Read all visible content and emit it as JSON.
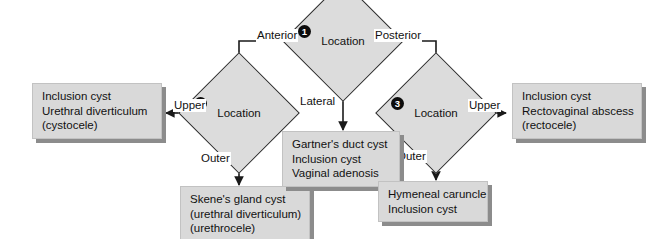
{
  "diagram": {
    "colors": {
      "node_fill": "#dcdcdc",
      "node_stroke": "#2b2b2b",
      "box_fill": "#d9d9d9",
      "box_shadow": "#8c8c8c",
      "badge_fill": "#0c0c0c",
      "badge_text": "#ffffff",
      "background": "#ffffff",
      "edge_stroke": "#1a1a1a"
    },
    "decisions": [
      {
        "id": "d1",
        "badge": "1",
        "label": "Location"
      },
      {
        "id": "d2",
        "badge": "2",
        "label": "Location"
      },
      {
        "id": "d3",
        "badge": "3",
        "label": "Location"
      }
    ],
    "edge_labels": {
      "anterior": "Anterior",
      "posterior": "Posterior",
      "lateral": "Lateral",
      "upper_left": "Upper",
      "outer_left": "Outer",
      "upper_right": "Upper",
      "outer_right": "Outer"
    },
    "outcomes": [
      {
        "id": "outcome-anterior-upper",
        "lines": [
          "Inclusion cyst",
          "Urethral diverticulum",
          "(cystocele)"
        ]
      },
      {
        "id": "outcome-anterior-outer",
        "lines": [
          "Skene's gland cyst",
          "(urethral diverticulum)",
          "(urethrocele)"
        ]
      },
      {
        "id": "outcome-lateral",
        "lines": [
          "Gartner's duct cyst",
          "Inclusion cyst",
          "Vaginal adenosis"
        ]
      },
      {
        "id": "outcome-posterior-upper",
        "lines": [
          "Inclusion cyst",
          "Rectovaginal abscess",
          "(rectocele)"
        ]
      },
      {
        "id": "outcome-posterior-outer",
        "lines": [
          "Hymeneal caruncle",
          "Inclusion cyst"
        ]
      }
    ]
  }
}
